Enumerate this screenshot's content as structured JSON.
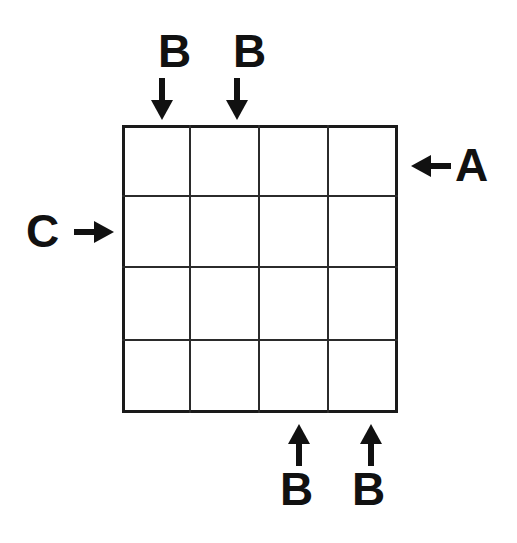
{
  "diagram": {
    "shape": "4x4-grid",
    "background_color": "#ffffff",
    "stroke_color": "#1a1a1a",
    "grid": {
      "rows": 4,
      "columns": 4,
      "left": 122,
      "top": 125,
      "width": 276,
      "height": 288,
      "outer_border_px": 3,
      "inner_line_px": 2,
      "column_x": [
        122,
        191,
        260,
        329,
        398
      ],
      "row_y": [
        125,
        197,
        268,
        341,
        413
      ]
    },
    "annotations": [
      {
        "id": "top-left-b",
        "label": "B",
        "icon": "arrow-down-icon",
        "direction": "down",
        "side": "top",
        "label_x": 158,
        "label_y": 28,
        "arrow_x": 151,
        "arrow_y": 78,
        "target_column": 1
      },
      {
        "id": "top-right-b",
        "label": "B",
        "icon": "arrow-down-icon",
        "direction": "down",
        "side": "top",
        "label_x": 233,
        "label_y": 28,
        "arrow_x": 226,
        "arrow_y": 78,
        "target_column": 2
      },
      {
        "id": "right-a",
        "label": "A",
        "icon": "arrow-left-icon",
        "direction": "left",
        "side": "right",
        "label_x": 455,
        "label_y": 142,
        "arrow_x": 411,
        "arrow_y": 155,
        "target_row": 1
      },
      {
        "id": "left-c",
        "label": "C",
        "icon": "arrow-right-icon",
        "direction": "right",
        "side": "left",
        "label_x": 26,
        "label_y": 208,
        "arrow_x": 74,
        "arrow_y": 221,
        "target_row": 2
      },
      {
        "id": "bottom-left-b",
        "label": "B",
        "icon": "arrow-up-icon",
        "direction": "up",
        "side": "bottom",
        "label_x": 280,
        "label_y": 466,
        "arrow_x": 288,
        "arrow_y": 424,
        "target_column": 3
      },
      {
        "id": "bottom-right-b",
        "label": "B",
        "icon": "arrow-up-icon",
        "direction": "up",
        "side": "bottom",
        "label_x": 352,
        "label_y": 466,
        "arrow_x": 360,
        "arrow_y": 424,
        "target_column": 4
      }
    ]
  }
}
